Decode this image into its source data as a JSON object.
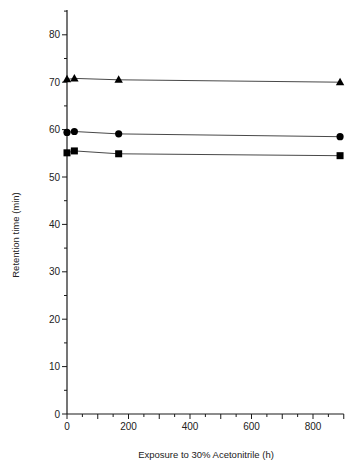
{
  "chart_data": {
    "type": "line",
    "title": "",
    "xlabel": "Exposure to 30% Acetonitrile (h)",
    "ylabel": "Retention time (min)",
    "xlim": [
      0,
      900
    ],
    "ylim": [
      0,
      85
    ],
    "x_ticks": [
      0,
      200,
      400,
      600,
      800
    ],
    "y_ticks": [
      0,
      10,
      20,
      30,
      40,
      50,
      60,
      70,
      80
    ],
    "grid": false,
    "legend": null,
    "x": [
      0,
      24,
      168,
      888
    ],
    "series": [
      {
        "name": "triangle",
        "marker": "triangle",
        "values": [
          70.6,
          70.8,
          70.5,
          70.0
        ]
      },
      {
        "name": "circle",
        "marker": "circle",
        "values": [
          59.4,
          59.6,
          59.1,
          58.5
        ]
      },
      {
        "name": "square",
        "marker": "square",
        "values": [
          55.1,
          55.5,
          54.9,
          54.5
        ]
      }
    ]
  }
}
